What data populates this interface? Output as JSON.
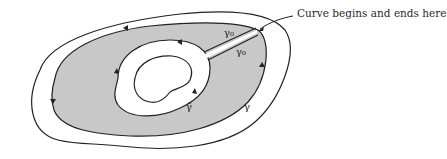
{
  "figure": {
    "type": "contour-diagram",
    "annotation": "Curve begins and ends here",
    "labels": {
      "gamma": "γ",
      "gamma_tilde": "γ̃",
      "gamma_0_top": "γ₀",
      "gamma_0_bottom": "γ₀"
    },
    "colors": {
      "shaded_region": "#c8c8c8",
      "stroke": "#222222",
      "background": "#ffffff"
    }
  }
}
